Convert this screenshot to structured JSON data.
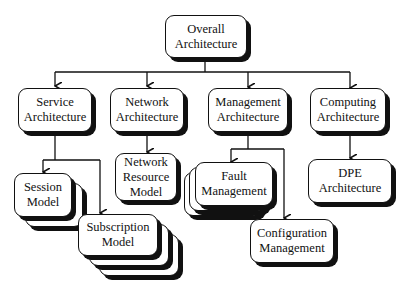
{
  "diagram": {
    "type": "hierarchy",
    "root": {
      "id": "overall",
      "label": "Overall\nArchitecture"
    },
    "level1": [
      {
        "id": "service",
        "label": "Service\nArchitecture"
      },
      {
        "id": "network",
        "label": "Network\nArchitecture"
      },
      {
        "id": "management",
        "label": "Management\nArchitecture"
      },
      {
        "id": "computing",
        "label": "Computing\nArchitecture"
      }
    ],
    "level2": [
      {
        "id": "session",
        "parent": "service",
        "label": "Session\nModel",
        "stacked": 2
      },
      {
        "id": "subscription",
        "parent": "service",
        "label": "Subscription\nModel",
        "stacked": 3
      },
      {
        "id": "network_resource",
        "parent": "network",
        "label": "Network\nResource\nModel",
        "stacked": 1
      },
      {
        "id": "fault",
        "parent": "management",
        "label": "Fault\nManagement",
        "stacked": 3
      },
      {
        "id": "configuration",
        "parent": "management",
        "label": "Configuration\nManagement",
        "stacked": 1
      },
      {
        "id": "dpe",
        "parent": "computing",
        "label": "DPE\nArchitecture",
        "stacked": 1
      }
    ],
    "edges": [
      [
        "overall",
        "service"
      ],
      [
        "overall",
        "network"
      ],
      [
        "overall",
        "management"
      ],
      [
        "overall",
        "computing"
      ],
      [
        "service",
        "session"
      ],
      [
        "service",
        "subscription"
      ],
      [
        "network",
        "network_resource"
      ],
      [
        "management",
        "fault"
      ],
      [
        "management",
        "configuration"
      ],
      [
        "computing",
        "dpe"
      ]
    ]
  }
}
